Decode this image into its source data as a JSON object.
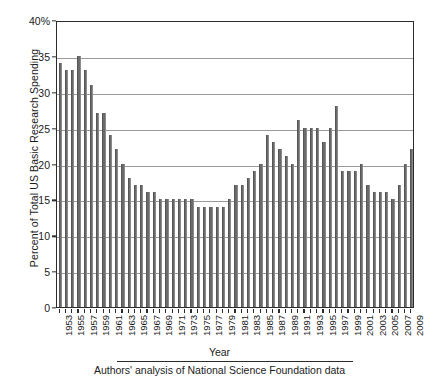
{
  "chart_data": {
    "type": "bar",
    "title": "",
    "subtitle": "",
    "xlabel": "Year",
    "ylabel": "Percent of Total US Basic Research Spending",
    "ylim": [
      0,
      40
    ],
    "ytick_values": [
      0,
      5,
      10,
      15,
      20,
      25,
      30,
      35,
      40
    ],
    "ytick_labels": [
      "0",
      "5",
      "10",
      "15",
      "20",
      "25",
      "30",
      "35",
      "40%"
    ],
    "grid": "horizontal",
    "legend": "none",
    "bar_color": "#6b6b6b",
    "axis_color": "#2b2b2b",
    "gridline_color": "#9a9a9a",
    "xtick_label_interval": 2,
    "xtick_labels": [
      "1953",
      "1955",
      "1957",
      "1959",
      "1961",
      "1963",
      "1965",
      "1967",
      "1969",
      "1971",
      "1973",
      "1975",
      "1977",
      "1979",
      "1981",
      "1983",
      "1985",
      "1987",
      "1989",
      "1991",
      "1993",
      "1995",
      "1997",
      "1999",
      "2001",
      "2003",
      "2005",
      "2007",
      "2009"
    ],
    "categories": [
      "1953",
      "1954",
      "1955",
      "1956",
      "1957",
      "1958",
      "1959",
      "1960",
      "1961",
      "1962",
      "1963",
      "1964",
      "1965",
      "1966",
      "1967",
      "1968",
      "1969",
      "1970",
      "1971",
      "1972",
      "1973",
      "1974",
      "1975",
      "1976",
      "1977",
      "1978",
      "1979",
      "1980",
      "1981",
      "1982",
      "1983",
      "1984",
      "1985",
      "1986",
      "1987",
      "1988",
      "1989",
      "1990",
      "1991",
      "1992",
      "1993",
      "1994",
      "1995",
      "1996",
      "1997",
      "1998",
      "1999",
      "2000",
      "2001",
      "2002",
      "2003",
      "2004",
      "2005",
      "2006",
      "2007",
      "2008",
      "2009"
    ],
    "values": [
      34,
      33,
      33,
      35,
      33,
      31,
      27,
      27,
      24,
      22,
      20,
      18,
      17,
      17,
      16,
      16,
      15,
      15,
      15,
      15,
      15,
      15,
      14,
      14,
      14,
      14,
      14,
      15,
      17,
      17,
      18,
      19,
      20,
      24,
      23,
      22,
      21,
      20,
      26,
      25,
      25,
      25,
      23,
      25,
      28,
      19,
      19,
      19,
      20,
      17,
      16,
      16,
      16,
      15,
      17,
      20,
      22
    ],
    "annotations": []
  },
  "caption": {
    "source_note": "Authors' analysis of National Science Foundation data"
  }
}
